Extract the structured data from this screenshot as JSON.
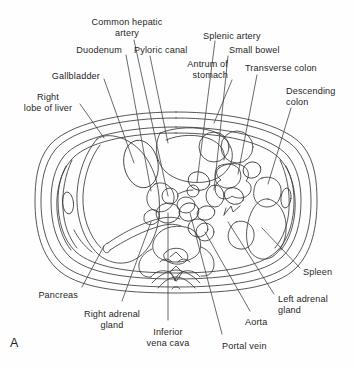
{
  "figure": {
    "panel_letter": "A",
    "kind": "anatomical-line-drawing",
    "stroke_color": "#3a3a3a",
    "background_color": "#ffffff"
  },
  "labels": [
    {
      "id": "common-hepatic-artery",
      "text": "Common hepatic\nartery",
      "x": 127,
      "y": 17,
      "align": "c"
    },
    {
      "id": "duodenum",
      "text": "Duodenum",
      "x": 122,
      "y": 45,
      "align": "r"
    },
    {
      "id": "pyloric-canal",
      "text": "Pyloric canal",
      "x": 134,
      "y": 45,
      "align": "l"
    },
    {
      "id": "splenic-artery",
      "text": "Splenic artery",
      "x": 203,
      "y": 31,
      "align": "l"
    },
    {
      "id": "small-bowel",
      "text": "Small bowel",
      "x": 229,
      "y": 45,
      "align": "l"
    },
    {
      "id": "antrum-of-stomach",
      "text": "Antrum of\nstomach",
      "x": 228,
      "y": 59,
      "align": "r"
    },
    {
      "id": "transverse-colon",
      "text": "Transverse colon",
      "x": 245,
      "y": 63,
      "align": "l"
    },
    {
      "id": "descending-colon",
      "text": "Descending\ncolon",
      "x": 286,
      "y": 86,
      "align": "l"
    },
    {
      "id": "gallbladder",
      "text": "Gallbladder",
      "x": 100,
      "y": 71,
      "align": "r"
    },
    {
      "id": "right-lobe-of-liver",
      "text": "Right\nlobe of liver",
      "x": 48,
      "y": 92,
      "align": "c"
    },
    {
      "id": "pancreas",
      "text": "Pancreas",
      "x": 78,
      "y": 290,
      "align": "r"
    },
    {
      "id": "right-adrenal-gland",
      "text": "Right adrenal\ngland",
      "x": 112,
      "y": 309,
      "align": "c"
    },
    {
      "id": "inferior-vena-cava",
      "text": "Inferior\nvena cava",
      "x": 168,
      "y": 327,
      "align": "c"
    },
    {
      "id": "portal-vein",
      "text": "Portal vein",
      "x": 222,
      "y": 341,
      "align": "l"
    },
    {
      "id": "aorta",
      "text": "Aorta",
      "x": 245,
      "y": 317,
      "align": "l"
    },
    {
      "id": "left-adrenal-gland",
      "text": "Left adrenal\ngland",
      "x": 278,
      "y": 294,
      "align": "l"
    },
    {
      "id": "spleen",
      "text": "Spleen",
      "x": 303,
      "y": 267,
      "align": "l"
    }
  ],
  "leader_lines": [
    {
      "for": "common-hepatic-artery",
      "points": "134,40 168,196"
    },
    {
      "for": "duodenum",
      "points": "126,55 151,191"
    },
    {
      "for": "pyloric-canal",
      "points": "150,56 168,143"
    },
    {
      "for": "splenic-artery",
      "points": "215,41 197,182"
    },
    {
      "for": "small-bowel",
      "points": "228,56 214,190"
    },
    {
      "for": "antrum-of-stomach",
      "points": "232,80 214,123"
    },
    {
      "for": "transverse-colon",
      "points": "257,75 238,174"
    },
    {
      "for": "descending-colon",
      "points": "291,108 268,184"
    },
    {
      "for": "gallbladder",
      "points": "104,79 134,163"
    },
    {
      "for": "right-lobe-of-liver",
      "points": "80,104 104,138"
    },
    {
      "for": "pancreas",
      "points": "82,287 104,246"
    },
    {
      "for": "right-adrenal-gland",
      "points": "122,301 151,222"
    },
    {
      "for": "inferior-vena-cava",
      "points": "168,320 168,213"
    },
    {
      "for": "portal-vein",
      "points": "222,334 190,213"
    },
    {
      "for": "aorta",
      "points": "250,311 205,232"
    },
    {
      "for": "left-adrenal-gland",
      "points": "274,294 228,222"
    },
    {
      "for": "spleen",
      "points": "300,268 262,228"
    }
  ]
}
